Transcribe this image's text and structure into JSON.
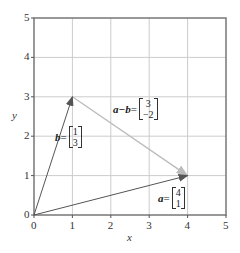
{
  "chart_data": {
    "type": "line",
    "title": "",
    "xlabel": "x",
    "ylabel": "y",
    "xlim": [
      0,
      5
    ],
    "ylim": [
      0,
      5
    ],
    "grid": true,
    "x_ticks": [
      "0",
      "1",
      "2",
      "3",
      "4",
      "5"
    ],
    "y_ticks": [
      "0",
      "1",
      "2",
      "3",
      "4",
      "5"
    ],
    "series": [
      {
        "name": "a",
        "from": [
          0,
          0
        ],
        "to": [
          4,
          1
        ],
        "color": "#555555",
        "label": "a",
        "components": [
          "4",
          "1"
        ]
      },
      {
        "name": "b",
        "from": [
          0,
          0
        ],
        "to": [
          1,
          3
        ],
        "color": "#555555",
        "label": "b",
        "components": [
          "1",
          "3"
        ]
      },
      {
        "name": "a−b",
        "from": [
          1,
          3
        ],
        "to": [
          4,
          1
        ],
        "color": "#bbbbbb",
        "label": "a−b",
        "components": [
          "3",
          "−2"
        ]
      }
    ]
  },
  "labels": {
    "x_axis": "x",
    "y_axis": "y",
    "vec_a": "a",
    "vec_b": "b",
    "vec_amb": "a−b",
    "eq": "=",
    "a_c1": "4",
    "a_c2": "1",
    "b_c1": "1",
    "b_c2": "3",
    "amb_c1": "3",
    "amb_c2": "−2",
    "ticks": [
      "0",
      "1",
      "2",
      "3",
      "4",
      "5"
    ]
  },
  "colors": {
    "axis": "#777777",
    "grid": "#cccccc",
    "vector": "#555555",
    "difference": "#bbbbbb"
  }
}
